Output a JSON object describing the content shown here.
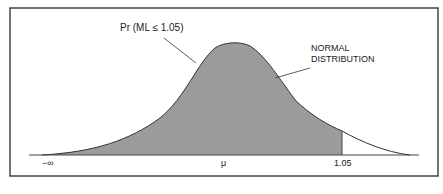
{
  "diagram": {
    "callout_probability": "Pr (ML ≤ 1.05)",
    "callout_curve_line1": "NORMAL",
    "callout_curve_line2": "DISTRIBUTION",
    "axis_labels": {
      "left": "−∞",
      "center": "μ",
      "cutoff": "1.05"
    },
    "colors": {
      "shade": "#9b9b9b",
      "line": "#333333",
      "frame": "#444444"
    }
  }
}
